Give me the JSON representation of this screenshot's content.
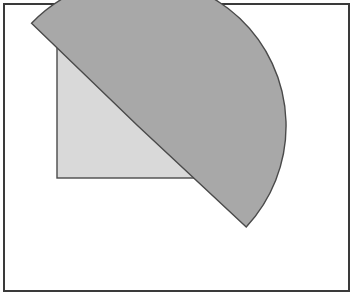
{
  "canvas": {
    "width": 362,
    "height": 298,
    "background_color": "#ffffff"
  },
  "figure": {
    "border_frame": {
      "label": "outer-frame",
      "x": 4,
      "y": 4,
      "width": 345,
      "height": 287,
      "stroke_color": "#3a3a3a",
      "stroke_width": 2,
      "fill_color": "#ffffff"
    },
    "shapes": [
      {
        "name": "light-rectangle",
        "type": "rectangle",
        "x": 57,
        "y": 36,
        "width": 162,
        "height": 142,
        "fill_color": "#d9d9d9",
        "stroke_color": "#4a4a4a",
        "stroke_width": 1.4,
        "z_order": 1
      },
      {
        "name": "gray-pie-sector",
        "type": "pie-sector",
        "center_x": 138,
        "center_y": 126,
        "radius": 148,
        "start_angle_deg": -136,
        "end_angle_deg": 43,
        "sweep_deg": 245,
        "arc_top_y": 94,
        "arc_right_x": 286,
        "tip_x": 253,
        "tip_y": 240,
        "fill_color": "#a8a8a8",
        "stroke_color": "#4a4a4a",
        "stroke_width": 1.4,
        "z_order": 2
      }
    ]
  }
}
